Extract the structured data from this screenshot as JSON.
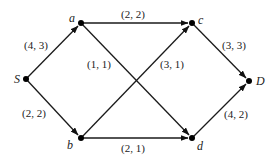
{
  "diagram": {
    "type": "flow-network",
    "nodes": [
      {
        "id": "S",
        "label": "S"
      },
      {
        "id": "a",
        "label": "a"
      },
      {
        "id": "b",
        "label": "b"
      },
      {
        "id": "c",
        "label": "c"
      },
      {
        "id": "d",
        "label": "d"
      },
      {
        "id": "D",
        "label": "D"
      }
    ],
    "edges": [
      {
        "from": "S",
        "to": "a",
        "label": "(4, 3)",
        "capacity": 4,
        "flow": 3
      },
      {
        "from": "S",
        "to": "b",
        "label": "(2, 2)",
        "capacity": 2,
        "flow": 2
      },
      {
        "from": "a",
        "to": "c",
        "label": "(2, 2)",
        "capacity": 2,
        "flow": 2
      },
      {
        "from": "a",
        "to": "d",
        "label": "(1, 1)",
        "capacity": 1,
        "flow": 1
      },
      {
        "from": "b",
        "to": "c",
        "label": "(3, 1)",
        "capacity": 3,
        "flow": 1
      },
      {
        "from": "b",
        "to": "d",
        "label": "(2, 1)",
        "capacity": 2,
        "flow": 1
      },
      {
        "from": "c",
        "to": "D",
        "label": "(3, 3)",
        "capacity": 3,
        "flow": 3
      },
      {
        "from": "d",
        "to": "D",
        "label": "(4, 2)",
        "capacity": 4,
        "flow": 2
      }
    ]
  }
}
